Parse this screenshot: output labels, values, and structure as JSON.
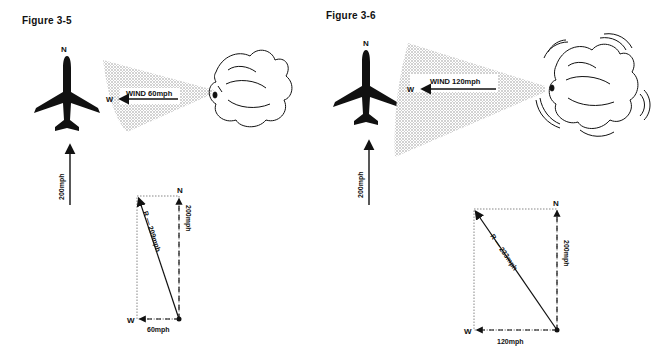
{
  "figures": [
    {
      "title": "Figure 3-5",
      "north_label": "N",
      "wind": {
        "direction_label": "W",
        "label": "WIND 60mph"
      },
      "aircraft_speed_label": "200mph",
      "vector_diagram": {
        "north_label": "N",
        "west_label": "W",
        "north_component": "200mph",
        "west_component": "60mph",
        "resultant": "R — 209mph"
      }
    },
    {
      "title": "Figure 3-6",
      "north_label": "N",
      "wind": {
        "direction_label": "W",
        "label": "WIND 120mph"
      },
      "aircraft_speed_label": "200mph",
      "vector_diagram": {
        "north_label": "N",
        "west_label": "W",
        "north_component": "200mph",
        "west_component": "120mph",
        "resultant": "R — 233mph"
      }
    }
  ]
}
